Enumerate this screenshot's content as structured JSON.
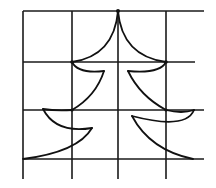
{
  "diagram": {
    "colors": {
      "background": "#ffffff",
      "ink": "#111111"
    },
    "grid": {
      "columns": 4,
      "rows": 3,
      "vertical_x": [
        23,
        72,
        118,
        166
      ],
      "horizontal_y": [
        11,
        62,
        110,
        159
      ]
    }
  }
}
